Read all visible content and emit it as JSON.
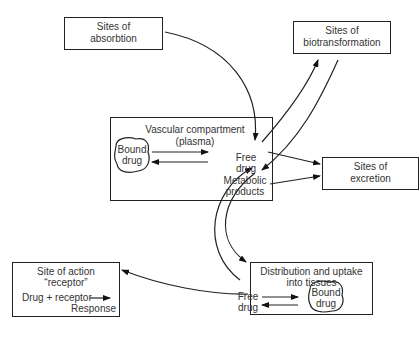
{
  "nodes": {
    "absorption": {
      "line1": "Sites of",
      "line2": "absorbtion"
    },
    "biotransformation": {
      "line1": "Sites of",
      "line2": "biotransformation"
    },
    "vascular": {
      "title1": "Vascular compartment",
      "title2": "(plasma)",
      "bound1": "Bound",
      "bound2": "drug",
      "free1": "Free",
      "free2": "drug",
      "meta1": "Metabolic",
      "meta2": "products"
    },
    "excretion": {
      "line1": "Sites of",
      "line2": "excretion"
    },
    "site_of_action": {
      "line1": "Site of action",
      "line2": "“receptor”",
      "line3": "Drug + receptor",
      "line4": "Response"
    },
    "tissues": {
      "title1": "Distribution and uptake",
      "title2": "into tissues",
      "free1": "Free",
      "free2": "drug",
      "bound1": "Bound",
      "bound2": "drug"
    }
  }
}
